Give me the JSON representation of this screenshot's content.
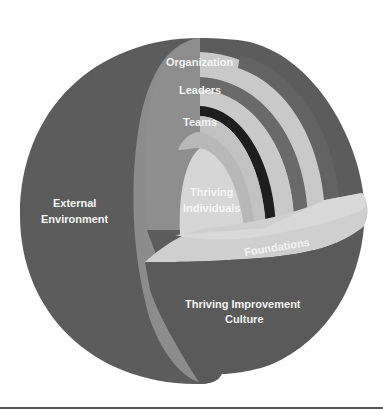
{
  "diagram": {
    "colors": {
      "outer_shell": "#5c5c5c",
      "cut_face": "#8c8c8c",
      "light_band": "#c9c9c9",
      "dark_stripe": "#6a6a6a",
      "black_stripe": "#1e1e1e",
      "core": "#d6d6d6",
      "foundations": "#cfcfcf",
      "label_text": "#f4f4f4",
      "baseline": "#555555"
    },
    "layers": {
      "organization": "Organization",
      "leaders": "Leaders",
      "teams": "Teams",
      "individuals_line1": "Thriving",
      "individuals_line2": "Individuals",
      "foundations": "Foundations",
      "external_line1": "External",
      "external_line2": "Environment",
      "culture_line1": "Thriving Improvement",
      "culture_line2": "Culture"
    }
  }
}
